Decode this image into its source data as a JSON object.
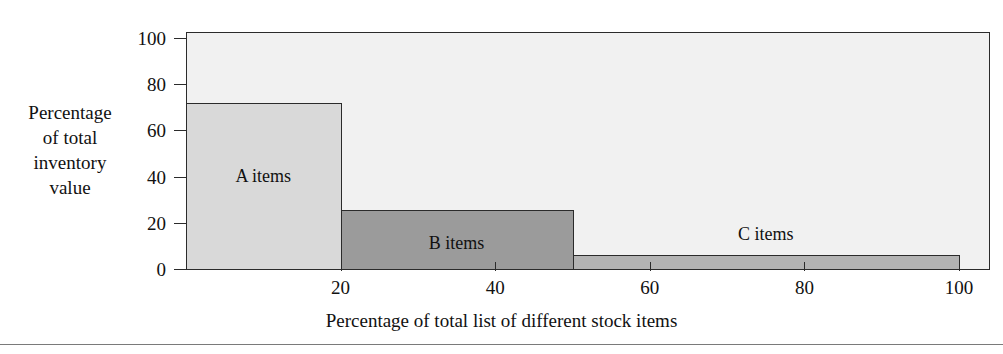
{
  "chart_data": {
    "type": "bar",
    "title": "",
    "subtitle": "",
    "xlabel": "Percentage of total list of different stock items",
    "ylabel": "Percentage of total inventory value",
    "ylabel_lines": [
      "Percentage",
      "of total",
      "inventory",
      "value"
    ],
    "xlim": [
      0,
      104
    ],
    "ylim": [
      0,
      103
    ],
    "grid": false,
    "legend": "none",
    "x_ticks": [
      20,
      40,
      60,
      80,
      100
    ],
    "x_tick_labels": [
      "20",
      "40",
      "60",
      "80",
      "100"
    ],
    "y_ticks": [
      0,
      20,
      40,
      60,
      80,
      100
    ],
    "y_tick_labels": [
      "0",
      "20",
      "40",
      "60",
      "80",
      "100"
    ],
    "categories": [
      "A items",
      "B items",
      "C items"
    ],
    "values": [
      72,
      25.5,
      6
    ],
    "bars": [
      {
        "label": "A items",
        "x_start": 0,
        "x_end": 20,
        "value": 72,
        "color": "#d9d9d9",
        "label_inside": true
      },
      {
        "label": "B items",
        "x_start": 20,
        "x_end": 50,
        "value": 25.5,
        "color": "#9b9b9b",
        "label_inside": true
      },
      {
        "label": "C items",
        "x_start": 50,
        "x_end": 100,
        "value": 6,
        "color": "#b3b3b3",
        "label_inside": false
      }
    ],
    "plot_background": "#f1f1f1",
    "axis_color": "#2b2b2b"
  }
}
